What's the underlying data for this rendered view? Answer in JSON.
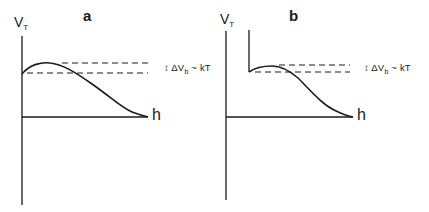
{
  "figure": {
    "panels": [
      {
        "id": "a",
        "letter": "a",
        "y_axis_label": "V",
        "y_axis_subscript": "T",
        "x_axis_label": "h",
        "annotation": {
          "arrow": "↕",
          "prefix": "ΔV",
          "subscript": "b",
          "suffix": "~ kT"
        },
        "description": "Potential barrier curve rising from finite value at origin to a maximum, then decaying to zero; dashed lines mark barrier height of order kT"
      },
      {
        "id": "b",
        "letter": "b",
        "y_axis_label": "V",
        "y_axis_subscript": "T",
        "x_axis_label": "h",
        "annotation": {
          "arrow": "↕",
          "prefix": "ΔV",
          "subscript": "b",
          "suffix": "~ kT"
        },
        "description": "Potential curve with hard wall at finite separation, small barrier maximum, then decaying to zero; dashed lines mark barrier height of order kT"
      }
    ],
    "colors": {
      "line": "#1a1a1a",
      "background": "#ffffff"
    }
  }
}
